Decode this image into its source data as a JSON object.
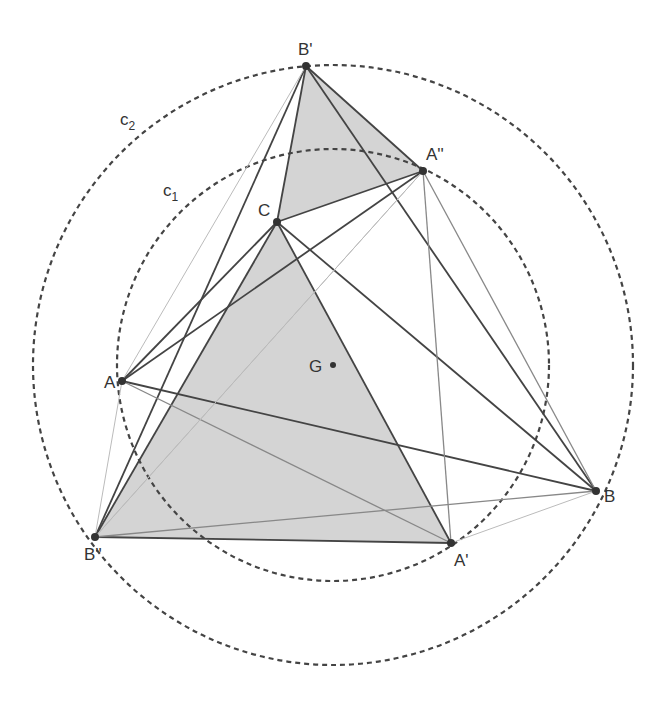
{
  "diagram": {
    "center": {
      "x": 333,
      "y": 365
    },
    "circles": [
      {
        "name": "c1",
        "label": "c",
        "subscript": "1",
        "r": 216,
        "label_pos": {
          "x": 163,
          "y": 196
        }
      },
      {
        "name": "c2",
        "label": "c",
        "subscript": "2",
        "r": 300,
        "label_pos": {
          "x": 120,
          "y": 125
        }
      }
    ],
    "points": [
      {
        "name": "A",
        "label": "A",
        "x": 122,
        "y": 381,
        "lx": 104,
        "ly": 388
      },
      {
        "name": "B",
        "label": "B",
        "x": 596,
        "y": 491,
        "lx": 604,
        "ly": 502
      },
      {
        "name": "C",
        "label": "C",
        "x": 277,
        "y": 222,
        "lx": 258,
        "ly": 216
      },
      {
        "name": "A'",
        "label": "A'",
        "x": 451,
        "y": 543,
        "lx": 454,
        "ly": 566
      },
      {
        "name": "B'",
        "label": "B'",
        "x": 306,
        "y": 66,
        "lx": 298,
        "ly": 55
      },
      {
        "name": "A''",
        "label": "A''",
        "x": 423,
        "y": 171,
        "lx": 426,
        "ly": 160
      },
      {
        "name": "B''",
        "label": "B''",
        "x": 95,
        "y": 537,
        "lx": 84,
        "ly": 560
      },
      {
        "name": "G",
        "label": "G",
        "x": 333,
        "y": 365,
        "lx": 309,
        "ly": 372
      }
    ],
    "colors": {
      "fill": "#d4d4d4",
      "stroke": "#444444",
      "light": "#aaaaaa"
    }
  }
}
